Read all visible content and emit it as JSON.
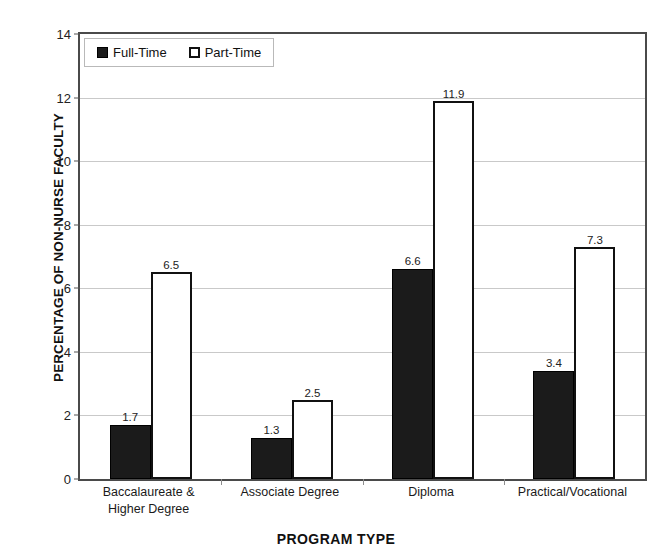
{
  "chart_data": {
    "type": "bar",
    "title": "",
    "xlabel": "PROGRAM TYPE",
    "ylabel": "PERCENTAGE OF NON-NURSE FACULTY",
    "categories": [
      "Baccalaureate &\nHigher Degree",
      "Associate Degree",
      "Diploma",
      "Practical/Vocational"
    ],
    "category_lines": [
      [
        "Baccalaureate &",
        "Higher Degree"
      ],
      [
        "Associate Degree"
      ],
      [
        "Diploma"
      ],
      [
        "Practical/Vocational"
      ]
    ],
    "series": [
      {
        "name": "Full-Time",
        "color": "#1b1b1b",
        "values": [
          1.7,
          1.3,
          6.6,
          3.4
        ]
      },
      {
        "name": "Part-Time",
        "color": "#ffffff",
        "values": [
          6.5,
          2.5,
          11.9,
          7.3
        ]
      }
    ],
    "ylim": [
      0,
      14
    ],
    "yticks": [
      0,
      2,
      4,
      6,
      8,
      10,
      12,
      14
    ],
    "ytick_labels": [
      "0",
      "2",
      "4",
      "6",
      "8",
      "10",
      "12",
      "14"
    ],
    "grid": true,
    "legend_position": "top-left"
  },
  "legend": {
    "entries": [
      {
        "label": "Full-Time",
        "swatch": "filled-square"
      },
      {
        "label": "Part-Time",
        "swatch": "outlined-square"
      }
    ]
  },
  "axis": {
    "y_title": "PERCENTAGE OF NON-NURSE FACULTY",
    "x_title": "PROGRAM TYPE"
  },
  "colors": {
    "full_time": "#1b1b1b",
    "part_time_fill": "#ffffff",
    "part_time_border": "#111111",
    "gridline": "#c9c9c9",
    "axis": "#4a4a4a"
  }
}
